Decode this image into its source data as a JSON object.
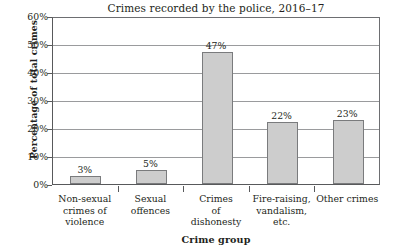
{
  "chart_data": {
    "type": "bar",
    "title": "Crimes recorded by the police, 2016–17",
    "xlabel": "Crime group",
    "ylabel": "Percentage of total crimes",
    "categories": [
      "Non-sexual\ncrimes of\nviolence",
      "Sexual\noffences",
      "Crimes\nof\ndishonesty",
      "Fire-raising,\nvandalism,\netc.",
      "Other crimes"
    ],
    "category_lines": [
      [
        "Non-sexual",
        "crimes of",
        "violence"
      ],
      [
        "Sexual",
        "offences"
      ],
      [
        "Crimes",
        "of",
        "dishonesty"
      ],
      [
        "Fire-raising,",
        "vandalism,",
        "etc."
      ],
      [
        "Other crimes"
      ]
    ],
    "values": [
      3,
      5,
      47,
      22,
      23
    ],
    "data_labels": [
      "3%",
      "5%",
      "47%",
      "22%",
      "23%"
    ],
    "ylim": [
      0,
      60
    ],
    "yticks": [
      0,
      10,
      20,
      30,
      40,
      50,
      60
    ],
    "ytick_labels": [
      "0%",
      "10%",
      "20%",
      "30%",
      "40%",
      "50%",
      "60%"
    ],
    "grid": true,
    "legend": "none",
    "bar_color": "#cdcdcd",
    "bar_border_color": "#7a7b7d",
    "gridline_color": "#9a9b9d",
    "axis_color": "#58595b",
    "text_color": "#231f20",
    "background": "#ffffff"
  }
}
